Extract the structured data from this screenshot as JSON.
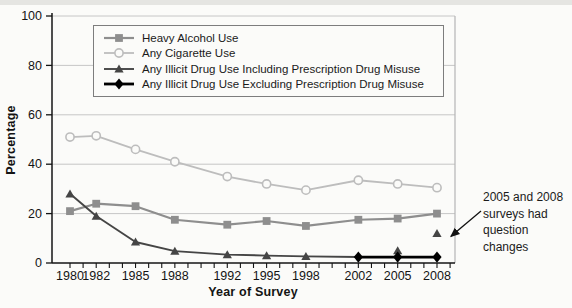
{
  "figure": {
    "background": "#fbfbf9",
    "axis_color": "#141414",
    "gridline_color": "#c6c6c6"
  },
  "chart_data": {
    "type": "line",
    "title": "",
    "xlabel": "Year of Survey",
    "ylabel": "Percentage",
    "ylim": [
      0,
      100
    ],
    "yticks": [
      0,
      20,
      40,
      60,
      80,
      100
    ],
    "xticks_labeled": [
      1980,
      1982,
      1985,
      1988,
      1992,
      1995,
      1998,
      2002,
      2005,
      2008
    ],
    "xticks_minor_range": [
      1980,
      2009
    ],
    "grid": true,
    "legend_position": "top-inside",
    "categories": [
      1980,
      1982,
      1985,
      1988,
      1992,
      1995,
      1998,
      2002,
      2005,
      2008
    ],
    "series": [
      {
        "name": "Heavy Alcohol Use",
        "marker": "square",
        "color": "#8e8e8e",
        "line_width": 2.2,
        "line_years": [
          1980,
          1982,
          1985,
          1988,
          1992,
          1995,
          1998,
          2002,
          2005,
          2008
        ],
        "line_values": [
          21,
          24,
          23,
          17.5,
          15.5,
          17,
          15,
          17.5,
          18,
          20
        ],
        "marker_points": [
          [
            1980,
            21
          ],
          [
            1982,
            24
          ],
          [
            1985,
            23
          ],
          [
            1988,
            17.5
          ],
          [
            1992,
            15.5
          ],
          [
            1995,
            17
          ],
          [
            1998,
            15
          ],
          [
            2002,
            17.5
          ],
          [
            2005,
            18
          ],
          [
            2008,
            20
          ]
        ]
      },
      {
        "name": "Any Cigarette Use",
        "marker": "circle-open",
        "color": "#bdbdbd",
        "line_width": 1.8,
        "line_years": [
          1980,
          1982,
          1985,
          1988,
          1992,
          1995,
          1998,
          2002,
          2005,
          2008
        ],
        "line_values": [
          51,
          51.5,
          46,
          41,
          35,
          32,
          29.5,
          33.5,
          32,
          30.5
        ],
        "marker_points": [
          [
            1980,
            51
          ],
          [
            1982,
            51.5
          ],
          [
            1985,
            46
          ],
          [
            1988,
            41
          ],
          [
            1992,
            35
          ],
          [
            1995,
            32
          ],
          [
            1998,
            29.5
          ],
          [
            2002,
            33.5
          ],
          [
            2005,
            32
          ],
          [
            2008,
            30.5
          ]
        ]
      },
      {
        "name": "Any Illicit Drug Use Including Prescription Drug Misuse",
        "marker": "triangle",
        "color": "#454545",
        "line_width": 1.9,
        "line_years": [
          1980,
          1982,
          1985,
          1988,
          1992,
          1995,
          1998,
          2002
        ],
        "line_values": [
          28,
          19,
          8.5,
          4.8,
          3.4,
          3,
          2.7,
          2.4
        ],
        "marker_points": [
          [
            1980,
            28
          ],
          [
            1982,
            19
          ],
          [
            1985,
            8.5
          ],
          [
            1988,
            4.8
          ],
          [
            1992,
            3.4
          ],
          [
            1995,
            3
          ],
          [
            1998,
            2.7
          ],
          [
            2005,
            5
          ],
          [
            2008,
            12
          ]
        ]
      },
      {
        "name": "Any Illicit Drug Use Excluding Prescription Drug Misuse",
        "marker": "diamond",
        "color": "#000000",
        "line_width": 2.8,
        "line_years": [
          2002,
          2005,
          2008
        ],
        "line_values": [
          2.4,
          2.4,
          2.4
        ],
        "marker_points": [
          [
            2002,
            2.4
          ],
          [
            2005,
            2.4
          ],
          [
            2008,
            2.4
          ]
        ]
      }
    ],
    "annotation": {
      "text": "2005 and 2008 surveys had question changes",
      "lines": [
        "2005 and 2008",
        "surveys had",
        "question",
        "changes"
      ],
      "arrow_target": {
        "year": 2008,
        "value": 12
      }
    }
  }
}
